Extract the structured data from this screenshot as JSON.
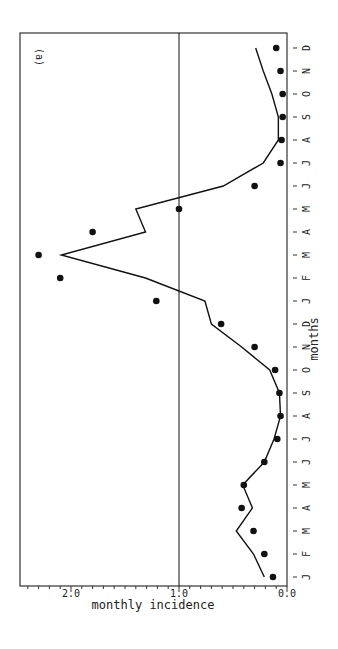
{
  "chart_data": {
    "type": "line",
    "title": "",
    "panel_label": "(a)",
    "xlabel": "months",
    "ylabel": "monthly incidence",
    "categories": [
      "J",
      "F",
      "M",
      "A",
      "M",
      "J",
      "J",
      "A",
      "S",
      "O",
      "N",
      "D",
      "J",
      "F",
      "M",
      "A",
      "M",
      "J",
      "J",
      "A",
      "S",
      "O",
      "N",
      "D"
    ],
    "ylim": [
      0.0,
      2.5
    ],
    "yticks": [
      0.0,
      1.0,
      2.0
    ],
    "ytick_labels": [
      "0.0",
      "1.0",
      "2.0"
    ],
    "reference_line": 1.0,
    "grid": false,
    "legend": null,
    "series": [
      {
        "name": "observed",
        "style": "points",
        "values": [
          0.13,
          0.21,
          0.31,
          0.42,
          0.4,
          0.21,
          0.09,
          0.06,
          0.07,
          0.11,
          0.3,
          0.61,
          1.21,
          2.1,
          2.3,
          1.8,
          1.0,
          0.3,
          0.06,
          0.05,
          0.04,
          0.04,
          0.06,
          0.1
        ]
      },
      {
        "name": "fitted",
        "style": "line",
        "values": [
          0.21,
          0.31,
          0.47,
          0.32,
          0.41,
          0.21,
          0.12,
          0.06,
          0.07,
          0.16,
          0.42,
          0.7,
          0.76,
          1.31,
          2.09,
          1.31,
          1.4,
          0.59,
          0.22,
          0.08,
          0.08,
          0.14,
          0.22,
          0.29
        ]
      }
    ]
  },
  "colors": {
    "ink": "#111111",
    "background": "#ffffff",
    "frame": "#333333"
  }
}
